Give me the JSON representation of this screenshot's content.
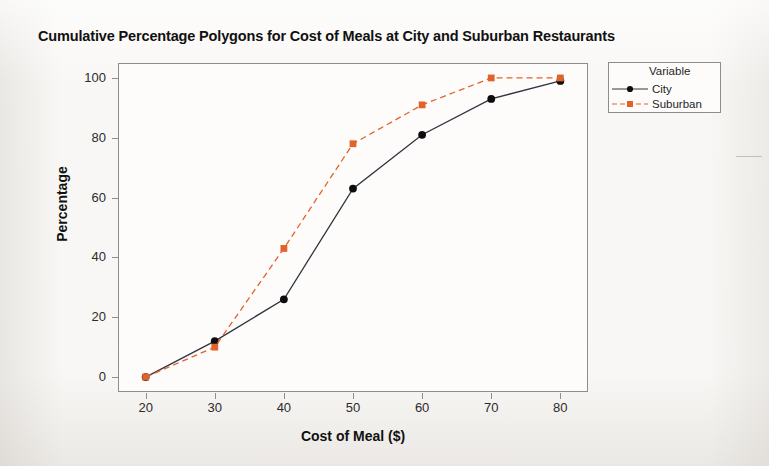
{
  "chart_data": {
    "type": "line",
    "title": "Cumulative Percentage Polygons for Cost of Meals at City and Suburban Restaurants",
    "xlabel": "Cost of Meal ($)",
    "ylabel": "Percentage",
    "x": [
      20,
      30,
      40,
      50,
      60,
      70,
      80
    ],
    "xlim": [
      16,
      84
    ],
    "ylim": [
      -5,
      105
    ],
    "xticks": [
      "20",
      "30",
      "40",
      "50",
      "60",
      "70",
      "80"
    ],
    "yticks": [
      "0",
      "20",
      "40",
      "60",
      "80",
      "100"
    ],
    "grid": false,
    "legend_position": "right",
    "legend_title": "Variable",
    "series": [
      {
        "name": "City",
        "values": [
          0,
          12,
          26,
          63,
          81,
          93,
          99
        ],
        "color": "#2e3440",
        "linestyle": "solid",
        "marker": "circle"
      },
      {
        "name": "Suburban",
        "values": [
          0,
          10,
          43,
          78,
          91,
          100,
          100
        ],
        "color": "#e2622c",
        "linestyle": "dashed",
        "marker": "square"
      }
    ]
  },
  "legend": {
    "title": "Variable",
    "items": [
      {
        "label": "City"
      },
      {
        "label": "Suburban"
      }
    ]
  },
  "axes": {
    "x_title": "Cost of Meal ($)",
    "y_title": "Percentage"
  },
  "colors": {
    "city": "#2e3440",
    "suburban": "#e2622c",
    "frame": "#8d8d8d",
    "page_background": "#f6f4f1",
    "plot_background": "#fdfcfb",
    "text": "#111111"
  }
}
